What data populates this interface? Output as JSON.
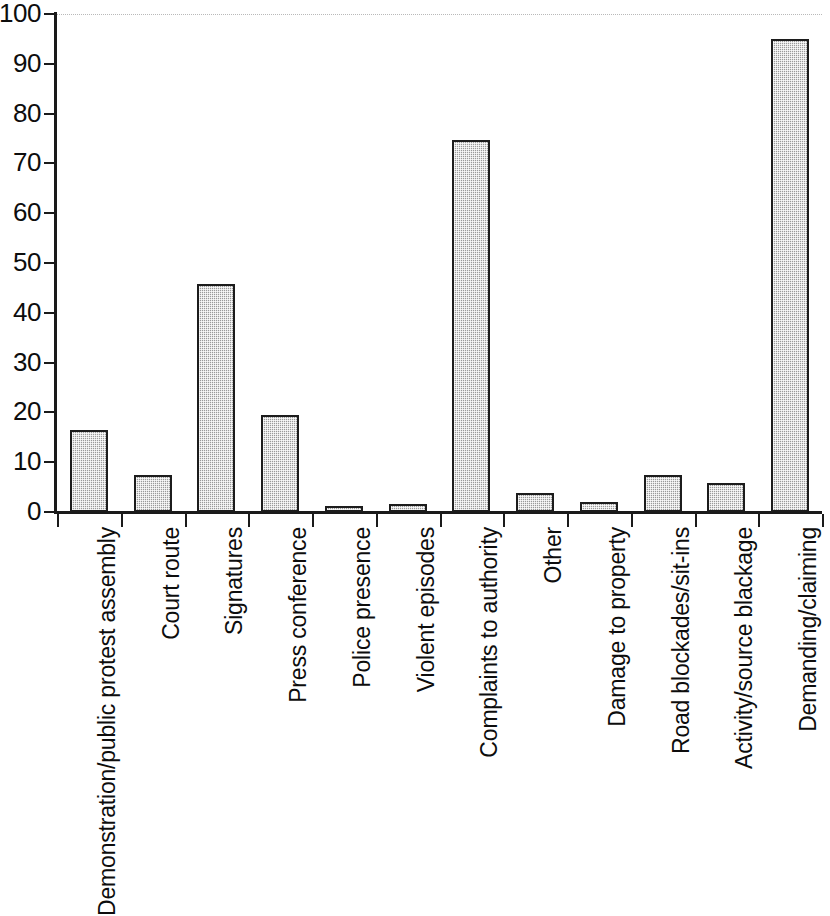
{
  "chart_data": {
    "type": "bar",
    "title": "",
    "subtitle": "",
    "xlabel": "",
    "ylabel": "",
    "ylim": [
      0,
      100
    ],
    "yticks": [
      0,
      10,
      20,
      30,
      40,
      50,
      60,
      70,
      80,
      90,
      100
    ],
    "ytick_labels": [
      "0",
      "10",
      "20",
      "30",
      "40",
      "50",
      "60",
      "70",
      "80",
      "90",
      "100"
    ],
    "grid": "top-dotted-only",
    "legend": "none",
    "orientation": "vertical",
    "bar_style": {
      "fill": "#9a9a9a",
      "pattern": "fine-dotted-hatch",
      "border": "#1c1c1c"
    },
    "categories": [
      "Demonstration/public protest assembly",
      "Court route",
      "Signatures",
      "Press conference",
      "Police presence",
      "Violent episodes",
      "Complaints to authority",
      "Other",
      "Damage to property",
      "Road blockades/sit-ins",
      "Activity/source blackage",
      "Demanding/claiming"
    ],
    "values": [
      16.5,
      7.5,
      45.7,
      19.4,
      1.2,
      1.6,
      74.6,
      3.8,
      2.0,
      7.4,
      5.8,
      95.0
    ]
  }
}
